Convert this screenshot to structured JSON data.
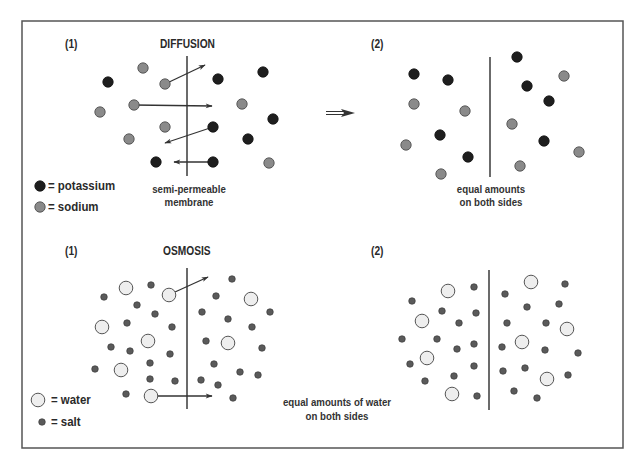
{
  "colors": {
    "background": "#ffffff",
    "frame": "#555555",
    "membrane": "#3a3a3a",
    "arrow": "#333333",
    "potassium": "#1e1e1e",
    "sodium": "#8a8a8a",
    "water_fill": "#eeeeee",
    "water_stroke": "#555555",
    "salt": "#5a5a5a"
  },
  "diffusion": {
    "title": "DIFFUSION",
    "panel1_label": "(1)",
    "panel2_label": "(2)",
    "membrane_caption_line1": "semi-permeable",
    "membrane_caption_line2": "membrane",
    "result_caption_line1": "equal amounts",
    "result_caption_line2": "on both sides",
    "legend": [
      {
        "symbol": "potassium",
        "label": "= potassium"
      },
      {
        "symbol": "sodium",
        "label": "= sodium"
      }
    ]
  },
  "osmosis": {
    "title": "OSMOSIS",
    "panel1_label": "(1)",
    "panel2_label": "(2)",
    "result_caption_line1": "equal amounts of water",
    "result_caption_line2": "on both sides",
    "legend": [
      {
        "symbol": "water",
        "label": "= water"
      },
      {
        "symbol": "salt",
        "label": "= salt"
      }
    ]
  },
  "diagram": {
    "frame": {
      "x": 22,
      "y": 21,
      "w": 601,
      "h": 427
    },
    "membranes": [
      {
        "x": 187,
        "y1": 56,
        "y2": 176
      },
      {
        "x": 490,
        "y1": 57,
        "y2": 177
      },
      {
        "x": 187,
        "y1": 268,
        "y2": 409
      },
      {
        "x": 489,
        "y1": 270,
        "y2": 410
      }
    ],
    "diffusion_1_particles": [
      {
        "t": "sodium",
        "x": 143,
        "y": 68
      },
      {
        "t": "potassium",
        "x": 108,
        "y": 82
      },
      {
        "t": "sodium",
        "x": 165,
        "y": 84
      },
      {
        "t": "potassium",
        "x": 218,
        "y": 79
      },
      {
        "t": "potassium",
        "x": 263,
        "y": 72
      },
      {
        "t": "sodium",
        "x": 134,
        "y": 105
      },
      {
        "t": "sodium",
        "x": 100,
        "y": 112
      },
      {
        "t": "sodium",
        "x": 242,
        "y": 104
      },
      {
        "t": "potassium",
        "x": 273,
        "y": 119
      },
      {
        "t": "sodium",
        "x": 165,
        "y": 127
      },
      {
        "t": "potassium",
        "x": 213,
        "y": 127
      },
      {
        "t": "sodium",
        "x": 129,
        "y": 139
      },
      {
        "t": "potassium",
        "x": 248,
        "y": 139
      },
      {
        "t": "potassium",
        "x": 156,
        "y": 162
      },
      {
        "t": "potassium",
        "x": 213,
        "y": 162
      },
      {
        "t": "sodium",
        "x": 269,
        "y": 163
      }
    ],
    "diffusion_1_arrows": [
      {
        "x1": 165,
        "y1": 84,
        "x2": 205,
        "y2": 65
      },
      {
        "x1": 134,
        "y1": 105,
        "x2": 212,
        "y2": 106
      },
      {
        "x1": 213,
        "y1": 127,
        "x2": 165,
        "y2": 143
      },
      {
        "x1": 213,
        "y1": 162,
        "x2": 174,
        "y2": 162
      }
    ],
    "diffusion_2_particles": [
      {
        "t": "potassium",
        "x": 414,
        "y": 74
      },
      {
        "t": "potassium",
        "x": 448,
        "y": 80
      },
      {
        "t": "sodium",
        "x": 414,
        "y": 104
      },
      {
        "t": "sodium",
        "x": 465,
        "y": 111
      },
      {
        "t": "potassium",
        "x": 440,
        "y": 135
      },
      {
        "t": "sodium",
        "x": 406,
        "y": 145
      },
      {
        "t": "potassium",
        "x": 468,
        "y": 157
      },
      {
        "t": "sodium",
        "x": 441,
        "y": 174
      },
      {
        "t": "potassium",
        "x": 517,
        "y": 57
      },
      {
        "t": "sodium",
        "x": 564,
        "y": 76
      },
      {
        "t": "potassium",
        "x": 527,
        "y": 86
      },
      {
        "t": "potassium",
        "x": 549,
        "y": 101
      },
      {
        "t": "sodium",
        "x": 512,
        "y": 124
      },
      {
        "t": "potassium",
        "x": 544,
        "y": 141
      },
      {
        "t": "sodium",
        "x": 579,
        "y": 152
      },
      {
        "t": "sodium",
        "x": 520,
        "y": 166
      }
    ],
    "transition_arrow": {
      "x1": 326,
      "y1": 113,
      "x2": 355,
      "y2": 113
    },
    "osmosis_1_particles": [
      {
        "t": "water",
        "x": 126,
        "y": 288
      },
      {
        "t": "water",
        "x": 169,
        "y": 295
      },
      {
        "t": "water",
        "x": 102,
        "y": 327
      },
      {
        "t": "water",
        "x": 148,
        "y": 341
      },
      {
        "t": "water",
        "x": 121,
        "y": 370
      },
      {
        "t": "water",
        "x": 151,
        "y": 396
      },
      {
        "t": "water",
        "x": 251,
        "y": 299
      },
      {
        "t": "water",
        "x": 228,
        "y": 343
      },
      {
        "t": "salt",
        "x": 151,
        "y": 285
      },
      {
        "t": "salt",
        "x": 104,
        "y": 297
      },
      {
        "t": "salt",
        "x": 137,
        "y": 305
      },
      {
        "t": "salt",
        "x": 155,
        "y": 314
      },
      {
        "t": "salt",
        "x": 127,
        "y": 323
      },
      {
        "t": "salt",
        "x": 172,
        "y": 327
      },
      {
        "t": "salt",
        "x": 111,
        "y": 347
      },
      {
        "t": "salt",
        "x": 130,
        "y": 351
      },
      {
        "t": "salt",
        "x": 170,
        "y": 354
      },
      {
        "t": "salt",
        "x": 95,
        "y": 369
      },
      {
        "t": "salt",
        "x": 150,
        "y": 363
      },
      {
        "t": "salt",
        "x": 150,
        "y": 379
      },
      {
        "t": "salt",
        "x": 175,
        "y": 381
      },
      {
        "t": "salt",
        "x": 126,
        "y": 394
      },
      {
        "t": "salt",
        "x": 232,
        "y": 279
      },
      {
        "t": "salt",
        "x": 216,
        "y": 296
      },
      {
        "t": "salt",
        "x": 202,
        "y": 312
      },
      {
        "t": "salt",
        "x": 228,
        "y": 319
      },
      {
        "t": "salt",
        "x": 270,
        "y": 312
      },
      {
        "t": "salt",
        "x": 252,
        "y": 327
      },
      {
        "t": "salt",
        "x": 206,
        "y": 341
      },
      {
        "t": "salt",
        "x": 262,
        "y": 348
      },
      {
        "t": "salt",
        "x": 214,
        "y": 364
      },
      {
        "t": "salt",
        "x": 240,
        "y": 372
      },
      {
        "t": "salt",
        "x": 258,
        "y": 375
      },
      {
        "t": "salt",
        "x": 201,
        "y": 380
      },
      {
        "t": "salt",
        "x": 218,
        "y": 385
      },
      {
        "t": "salt",
        "x": 233,
        "y": 398
      }
    ],
    "osmosis_1_arrows": [
      {
        "x1": 175,
        "y1": 292,
        "x2": 208,
        "y2": 277
      },
      {
        "x1": 157,
        "y1": 396,
        "x2": 212,
        "y2": 396
      }
    ],
    "osmosis_2_particles": [
      {
        "t": "water",
        "x": 448,
        "y": 291
      },
      {
        "t": "water",
        "x": 422,
        "y": 321
      },
      {
        "t": "water",
        "x": 427,
        "y": 358
      },
      {
        "t": "water",
        "x": 452,
        "y": 394
      },
      {
        "t": "water",
        "x": 531,
        "y": 282
      },
      {
        "t": "water",
        "x": 567,
        "y": 329
      },
      {
        "t": "water",
        "x": 522,
        "y": 342
      },
      {
        "t": "water",
        "x": 547,
        "y": 379
      },
      {
        "t": "salt",
        "x": 474,
        "y": 287
      },
      {
        "t": "salt",
        "x": 412,
        "y": 301
      },
      {
        "t": "salt",
        "x": 442,
        "y": 311
      },
      {
        "t": "salt",
        "x": 476,
        "y": 313
      },
      {
        "t": "salt",
        "x": 459,
        "y": 323
      },
      {
        "t": "salt",
        "x": 402,
        "y": 339
      },
      {
        "t": "salt",
        "x": 437,
        "y": 339
      },
      {
        "t": "salt",
        "x": 457,
        "y": 349
      },
      {
        "t": "salt",
        "x": 474,
        "y": 344
      },
      {
        "t": "salt",
        "x": 410,
        "y": 364
      },
      {
        "t": "salt",
        "x": 474,
        "y": 366
      },
      {
        "t": "salt",
        "x": 454,
        "y": 376
      },
      {
        "t": "salt",
        "x": 425,
        "y": 381
      },
      {
        "t": "salt",
        "x": 477,
        "y": 396
      },
      {
        "t": "salt",
        "x": 565,
        "y": 284
      },
      {
        "t": "salt",
        "x": 505,
        "y": 294
      },
      {
        "t": "salt",
        "x": 527,
        "y": 307
      },
      {
        "t": "salt",
        "x": 559,
        "y": 304
      },
      {
        "t": "salt",
        "x": 507,
        "y": 323
      },
      {
        "t": "salt",
        "x": 546,
        "y": 323
      },
      {
        "t": "salt",
        "x": 502,
        "y": 347
      },
      {
        "t": "salt",
        "x": 545,
        "y": 350
      },
      {
        "t": "salt",
        "x": 578,
        "y": 353
      },
      {
        "t": "salt",
        "x": 503,
        "y": 371
      },
      {
        "t": "salt",
        "x": 525,
        "y": 368
      },
      {
        "t": "salt",
        "x": 568,
        "y": 375
      },
      {
        "t": "salt",
        "x": 514,
        "y": 391
      },
      {
        "t": "salt",
        "x": 537,
        "y": 398
      }
    ],
    "legend_symbols": [
      {
        "t": "potassium",
        "x": 40,
        "y": 186
      },
      {
        "t": "sodium",
        "x": 40,
        "y": 207
      },
      {
        "t": "water",
        "x": 38,
        "y": 400
      },
      {
        "t": "salt",
        "x": 42,
        "y": 422
      }
    ]
  }
}
